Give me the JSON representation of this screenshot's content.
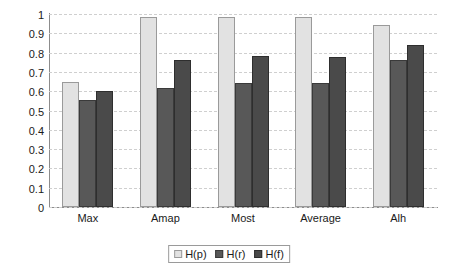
{
  "chart_data": {
    "type": "bar",
    "title": "",
    "xlabel": "",
    "ylabel": "",
    "ylim": [
      0,
      1
    ],
    "ytick_labels": [
      "0",
      "0.1",
      "0.2",
      "0.3",
      "0.4",
      "0.5",
      "0.6",
      "0.7",
      "0.8",
      "0.9",
      "1"
    ],
    "ytick_values": [
      0,
      0.1,
      0.2,
      0.3,
      0.4,
      0.5,
      0.6,
      0.7,
      0.8,
      0.9,
      1
    ],
    "grid": true,
    "legend_position": "bottom",
    "categories": [
      "Max",
      "Amap",
      "Most",
      "Average",
      "Alh"
    ],
    "series": [
      {
        "name": "H(p)",
        "color": "#e2e2e2",
        "values": [
          0.65,
          0.985,
          0.985,
          0.985,
          0.945
        ]
      },
      {
        "name": "H(r)",
        "color": "#585858",
        "values": [
          0.555,
          0.615,
          0.645,
          0.64,
          0.76
        ]
      },
      {
        "name": "H(f)",
        "color": "#4a4a4a",
        "values": [
          0.6,
          0.76,
          0.78,
          0.775,
          0.84
        ]
      }
    ]
  }
}
